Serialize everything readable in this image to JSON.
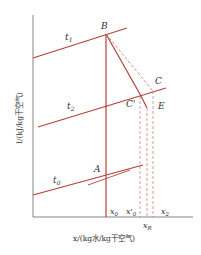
{
  "diagram": {
    "type": "psychrometric I-x (enthalpy-humidity) diagram",
    "colors": {
      "axis": "#555555",
      "line": "#b5413a",
      "dashed": "#c9706a",
      "text": "#333333",
      "background": "#ffffff"
    },
    "axes": {
      "y_label": "I/(kJ/kg干空气)",
      "x_label": "x/(kg水/kg干空气)"
    },
    "isotherms": [
      {
        "id": "t1",
        "label": "t",
        "subscript": "1"
      },
      {
        "id": "t2",
        "label": "t",
        "subscript": "2"
      },
      {
        "id": "t0",
        "label": "t",
        "subscript": "0"
      }
    ],
    "points": [
      {
        "id": "A",
        "label": "A"
      },
      {
        "id": "B",
        "label": "B"
      },
      {
        "id": "C",
        "label": "C"
      },
      {
        "id": "C-prime",
        "label": "C'"
      },
      {
        "id": "E",
        "label": "E"
      }
    ],
    "x_ticks": [
      {
        "id": "x0",
        "label": "x",
        "subscript": "0"
      },
      {
        "id": "x0-prime",
        "label": "x'",
        "subscript": "0"
      },
      {
        "id": "xR",
        "label": "x",
        "subscript": "R"
      },
      {
        "id": "x2",
        "label": "x",
        "subscript": "2"
      }
    ]
  }
}
